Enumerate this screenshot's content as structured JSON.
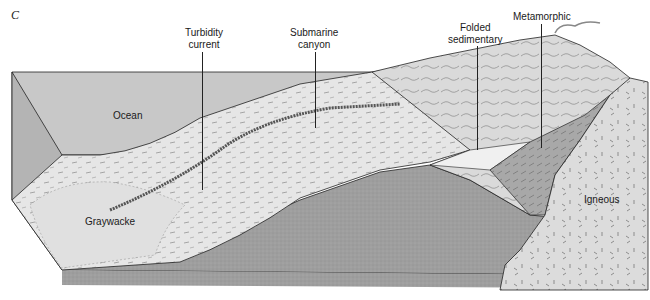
{
  "figure": {
    "panel_letter": "C",
    "type": "Block diagram of continental margin geology",
    "colors": {
      "ocean_water": "#c8c8c8",
      "ocean_side": "#b4b4b4",
      "sediment_surface": "#e6e6e6",
      "basement_gray": "#9e9e9e",
      "igneous": "#dcdcdc",
      "metamorphic": "#a8a8a8",
      "folded_sedimentary": "#f0f0f0",
      "outline": "#222222"
    }
  },
  "labels": {
    "ocean": "Ocean",
    "turbidity_current": [
      "Turbidity",
      "current"
    ],
    "submarine_canyon": [
      "Submarine",
      "canyon"
    ],
    "folded_sedimentary": [
      "Folded",
      "sedimentary"
    ],
    "metamorphic": "Metamorphic",
    "graywacke": "Graywacke",
    "igneous": "Igneous"
  }
}
